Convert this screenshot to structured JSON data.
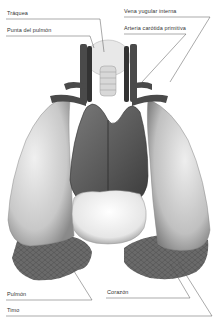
{
  "diagram": {
    "labels": {
      "traquea": "Tráquea",
      "punta_pulmon": "Punta del pulmón",
      "vena_yugular": "Vena yugular interna",
      "arteria_carotida": "Arteria carótida primitiva",
      "pulmon": "Pulmón",
      "corazon": "Corazón",
      "timo": "Timo"
    },
    "colors": {
      "line": "#555555",
      "lung_light": "#dcdcdc",
      "lung_dark": "#6a6a6a",
      "heart": "#5a5a5a",
      "thymus": "#f2f2f2",
      "vessel": "#4a4a4a"
    }
  }
}
